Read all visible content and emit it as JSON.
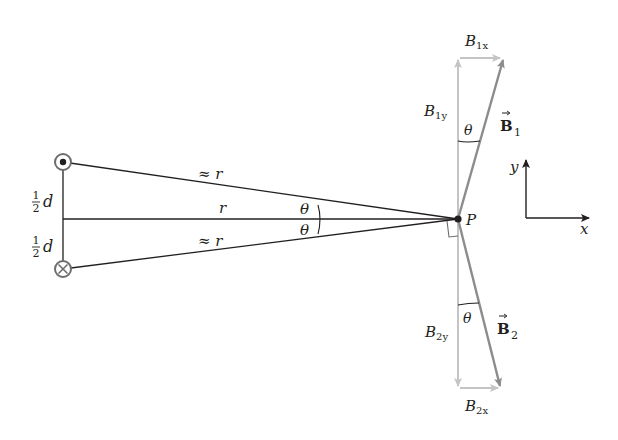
{
  "diagram": {
    "wires": {
      "top": {
        "symbol": "dot",
        "meaning": "current out of page"
      },
      "bottom": {
        "symbol": "cross",
        "meaning": "current into page"
      }
    },
    "labels": {
      "half_d_top_num": "1",
      "half_d_top_den": "2",
      "half_d_top_var": "d",
      "half_d_bottom_num": "1",
      "half_d_bottom_den": "2",
      "half_d_bottom_var": "d",
      "approx_r_top": "≈ r",
      "r_middle": "r",
      "approx_r_bottom": "≈ r",
      "theta_upper_left": "θ",
      "theta_lower_left": "θ",
      "point_p": "P",
      "b1x_main": "B",
      "b1x_sub": "1x",
      "b1y_main": "B",
      "b1y_sub": "1y",
      "theta_b1": "θ",
      "b1_vec_main": "B",
      "b1_vec_sub": "1",
      "b2y_main": "B",
      "b2y_sub": "2y",
      "theta_b2": "θ",
      "b2_vec_main": "B",
      "b2_vec_sub": "2",
      "b2x_main": "B",
      "b2x_sub": "2x",
      "axis_y": "y",
      "axis_x": "x"
    },
    "colors": {
      "line": "#231f20",
      "vector": "#8c8c8c",
      "component": "#c4c4c4"
    }
  }
}
